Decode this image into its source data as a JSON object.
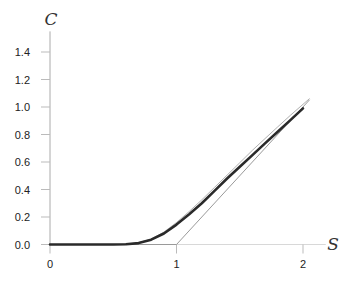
{
  "chart_data": {
    "type": "line",
    "title": "",
    "xlabel": "S",
    "ylabel": "C",
    "xlim": [
      0,
      2.2
    ],
    "ylim": [
      0,
      1.5
    ],
    "x_ticks": [
      "0",
      "1",
      "2"
    ],
    "y_ticks": [
      "0.0",
      "0.2",
      "0.4",
      "0.6",
      "0.8",
      "1.0",
      "1.2",
      "1.4"
    ],
    "grid": false,
    "legend": null,
    "series": [
      {
        "name": "payoff max(S-1,0)",
        "style": "thin-gray",
        "color": "#9a9a9a",
        "x": [
          0,
          1,
          2.05
        ],
        "y": [
          0,
          0,
          1.05
        ]
      },
      {
        "name": "option value (upper)",
        "style": "thin-gray",
        "color": "#b0b0b0",
        "x": [
          0,
          0.5,
          0.6,
          0.7,
          0.8,
          0.9,
          1.0,
          1.1,
          1.2,
          1.3,
          1.4,
          1.5,
          1.6,
          1.7,
          1.8,
          1.9,
          2.0,
          2.05
        ],
        "y": [
          0,
          0,
          0.003,
          0.012,
          0.04,
          0.09,
          0.16,
          0.24,
          0.325,
          0.415,
          0.505,
          0.595,
          0.685,
          0.77,
          0.855,
          0.94,
          1.02,
          1.06
        ]
      },
      {
        "name": "option value",
        "style": "thick-dark",
        "color": "#2a2a2a",
        "x": [
          0,
          0.5,
          0.6,
          0.7,
          0.8,
          0.9,
          1.0,
          1.1,
          1.2,
          1.3,
          1.4,
          1.5,
          1.6,
          1.7,
          1.8,
          1.9,
          2.0
        ],
        "y": [
          0,
          0,
          0.002,
          0.01,
          0.035,
          0.08,
          0.145,
          0.22,
          0.3,
          0.39,
          0.48,
          0.565,
          0.65,
          0.735,
          0.82,
          0.905,
          0.99
        ]
      }
    ]
  }
}
